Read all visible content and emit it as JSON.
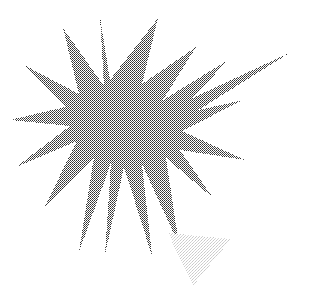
{
  "canvas": {
    "width": 321,
    "height": 289,
    "background_color": "#ffffff",
    "title": "Starburst Figure"
  },
  "palette": {
    "star_fill": "#6e6e6e",
    "star_halftone_dark": "#404040",
    "star_halftone_light": "#b4b4b4",
    "triangle_fill": "#e6e6e6",
    "triangle_halftone_dark": "#cfcfcf",
    "background": "#ffffff"
  },
  "shapes": [
    {
      "name": "starburst",
      "type": "star-polygon",
      "points": 12,
      "center": {
        "x": 124,
        "y": 135
      },
      "outer_radius": 118,
      "inner_radius": 46,
      "fill": "#6e6e6e",
      "texture": "halftone-dither",
      "polygon": "100,17 110,80 158,18 142,84 196,47 163,100 228,60 177,115 243,100 182,131 245,160 180,150 213,198 166,158 179,245 142,164 152,256 124,167 105,255 111,163 79,252 94,157 44,208 77,141 16,167 70,126 10,120 65,107 24,65 79,94 63,28 104,86",
      "long_spike": {
        "name": "elongated-ray",
        "tip": {
          "x": 291,
          "y": 52
        },
        "base_a": {
          "x": 150,
          "y": 118
        },
        "base_b": {
          "x": 160,
          "y": 134
        },
        "fill": "#808080"
      }
    },
    {
      "name": "inverted-triangle",
      "type": "triangle",
      "orientation": "point-down",
      "vertices": [
        {
          "x": 168,
          "y": 233
        },
        {
          "x": 231,
          "y": 239
        },
        {
          "x": 193,
          "y": 286
        }
      ],
      "fill": "#e6e6e6",
      "texture": "halftone-dither-light"
    }
  ],
  "labels": {
    "starburst": "starburst",
    "triangle": "inverted-triangle",
    "ray": "elongated-ray"
  }
}
